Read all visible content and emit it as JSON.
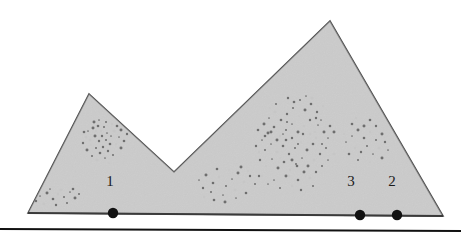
{
  "figure": {
    "kind": "scanned-geometry-figure",
    "canvas": {
      "width": 461,
      "height": 236
    },
    "background_color": "#ffffff",
    "polygon": {
      "name": "two-peak-mountain-polygon",
      "fill_color": "#dcdcdc",
      "stroke_color": "#4a4a4a",
      "stroke_width": 1.6,
      "points": "28,213 89,94 174,172 330,21 443,216"
    },
    "baseline": {
      "name": "baseline-segment",
      "stroke_color": "#3a3a3a",
      "stroke_width": 1.8,
      "x1": 28,
      "y1": 213,
      "x2": 443,
      "y2": 216
    },
    "page_rule": {
      "name": "page-rule",
      "stroke_color": "#111111",
      "stroke_width": 2.2,
      "x1": 0,
      "y1": 229,
      "x2": 461,
      "y2": 231
    },
    "markers": [
      {
        "label": "1",
        "cx": 113,
        "cy": 213,
        "r": 5.2,
        "color": "#111111",
        "label_x": 110,
        "label_y": 186
      },
      {
        "label": "3",
        "cx": 360,
        "cy": 215,
        "r": 5.2,
        "color": "#111111",
        "label_x": 351,
        "label_y": 186
      },
      {
        "label": "2",
        "cx": 397,
        "cy": 215,
        "r": 5.2,
        "color": "#111111",
        "label_x": 392,
        "label_y": 186
      }
    ],
    "speckle": {
      "color": "#6e6e6e",
      "noise_color": "#c6c6c6",
      "clusters": [
        {
          "name": "left-peak-cluster",
          "points": [
            [
              88,
              131
            ],
            [
              93,
              128
            ],
            [
              98,
              126
            ],
            [
              101,
              131
            ],
            [
              104,
              127
            ],
            [
              107,
              133
            ],
            [
              95,
              136
            ],
            [
              90,
              140
            ],
            [
              99,
              141
            ],
            [
              106,
              140
            ],
            [
              111,
              136
            ],
            [
              114,
              131
            ],
            [
              110,
              144
            ],
            [
              103,
              147
            ],
            [
              96,
              148
            ],
            [
              91,
              145
            ],
            [
              87,
              150
            ],
            [
              100,
              153
            ],
            [
              108,
              151
            ],
            [
              116,
              144
            ],
            [
              119,
              137
            ],
            [
              121,
              130
            ],
            [
              117,
              126
            ],
            [
              112,
              124
            ],
            [
              106,
              122
            ],
            [
              99,
              120
            ],
            [
              94,
              122
            ],
            [
              86,
              137
            ],
            [
              83,
              143
            ],
            [
              113,
              155
            ],
            [
              105,
              158
            ],
            [
              97,
              160
            ],
            [
              124,
              141
            ],
            [
              127,
              134
            ],
            [
              92,
              156
            ],
            [
              109,
              163
            ],
            [
              121,
              148
            ],
            [
              84,
              132
            ],
            [
              102,
              136
            ],
            [
              96,
              131
            ]
          ]
        },
        {
          "name": "bottom-left-sparse",
          "points": [
            [
              40,
              196
            ],
            [
              47,
              193
            ],
            [
              53,
              199
            ],
            [
              58,
              194
            ],
            [
              64,
              197
            ],
            [
              70,
              192
            ],
            [
              75,
              198
            ],
            [
              44,
              204
            ],
            [
              56,
              205
            ],
            [
              67,
              203
            ],
            [
              50,
              189
            ],
            [
              61,
              190
            ],
            [
              73,
              189
            ],
            [
              36,
              201
            ],
            [
              79,
              194
            ]
          ]
        },
        {
          "name": "lower-middle-sparse",
          "points": [
            [
              199,
              180
            ],
            [
              206,
              175
            ],
            [
              213,
              183
            ],
            [
              219,
              177
            ],
            [
              226,
              186
            ],
            [
              232,
              179
            ],
            [
              238,
              173
            ],
            [
              244,
              182
            ],
            [
              250,
              176
            ],
            [
              211,
              192
            ],
            [
              223,
              195
            ],
            [
              235,
              190
            ],
            [
              246,
              193
            ],
            [
              203,
              188
            ],
            [
              255,
              184
            ],
            [
              229,
              170
            ],
            [
              241,
              167
            ],
            [
              217,
              169
            ],
            [
              259,
              176
            ],
            [
              248,
              171
            ],
            [
              236,
              198
            ],
            [
              225,
              202
            ],
            [
              214,
              200
            ],
            [
              204,
              197
            ]
          ]
        },
        {
          "name": "right-main-cluster",
          "points": [
            [
              262,
              140
            ],
            [
              268,
              133
            ],
            [
              274,
              127
            ],
            [
              280,
              136
            ],
            [
              286,
              130
            ],
            [
              292,
              124
            ],
            [
              298,
              132
            ],
            [
              304,
              126
            ],
            [
              310,
              120
            ],
            [
              265,
              150
            ],
            [
              271,
              144
            ],
            [
              277,
              152
            ],
            [
              283,
              146
            ],
            [
              289,
              154
            ],
            [
              295,
              148
            ],
            [
              301,
              142
            ],
            [
              307,
              150
            ],
            [
              313,
              144
            ],
            [
              260,
              160
            ],
            [
              266,
              166
            ],
            [
              272,
              159
            ],
            [
              278,
              168
            ],
            [
              284,
              162
            ],
            [
              290,
              170
            ],
            [
              296,
              164
            ],
            [
              302,
              158
            ],
            [
              308,
              166
            ],
            [
              314,
              160
            ],
            [
              320,
              154
            ],
            [
              326,
              148
            ],
            [
              269,
              118
            ],
            [
              275,
              112
            ],
            [
              281,
              120
            ],
            [
              287,
              114
            ],
            [
              293,
              108
            ],
            [
              299,
              116
            ],
            [
              305,
              110
            ],
            [
              311,
              104
            ],
            [
              317,
              112
            ],
            [
              323,
              106
            ],
            [
              318,
              125
            ],
            [
              324,
              132
            ],
            [
              330,
              126
            ],
            [
              316,
              138
            ],
            [
              322,
              144
            ],
            [
              328,
              138
            ],
            [
              334,
              132
            ],
            [
              310,
              134
            ],
            [
              316,
              118
            ],
            [
              300,
              100
            ],
            [
              306,
              96
            ],
            [
              312,
              98
            ],
            [
              294,
              102
            ],
            [
              288,
              98
            ],
            [
              276,
              104
            ],
            [
              270,
              108
            ],
            [
              264,
              124
            ],
            [
              258,
              130
            ],
            [
              256,
              146
            ],
            [
              262,
              176
            ],
            [
              274,
              180
            ],
            [
              286,
              176
            ],
            [
              298,
              180
            ],
            [
              292,
              186
            ],
            [
              280,
              188
            ],
            [
              268,
              184
            ],
            [
              304,
              172
            ],
            [
              310,
              178
            ],
            [
              316,
              172
            ],
            [
              322,
              166
            ],
            [
              328,
              160
            ],
            [
              334,
              154
            ],
            [
              286,
              140
            ],
            [
              292,
              138
            ],
            [
              298,
              144
            ],
            [
              280,
              158
            ],
            [
              292,
              160
            ],
            [
              297,
              166
            ],
            [
              303,
              134
            ],
            [
              315,
              132
            ],
            [
              321,
              120
            ],
            [
              271,
              132
            ],
            [
              265,
              136
            ],
            [
              259,
              152
            ],
            [
              287,
              122
            ],
            [
              283,
              134
            ],
            [
              277,
              140
            ],
            [
              289,
              176
            ],
            [
              301,
              190
            ],
            [
              313,
              186
            ]
          ]
        },
        {
          "name": "right-small-cluster",
          "points": [
            [
              352,
              136
            ],
            [
              358,
              130
            ],
            [
              364,
              138
            ],
            [
              370,
              132
            ],
            [
              376,
              140
            ],
            [
              346,
              142
            ],
            [
              382,
              134
            ],
            [
              355,
              148
            ],
            [
              361,
              152
            ],
            [
              367,
              146
            ],
            [
              373,
              154
            ],
            [
              379,
              148
            ],
            [
              349,
              154
            ],
            [
              385,
              142
            ],
            [
              358,
              160
            ],
            [
              370,
              162
            ],
            [
              364,
              126
            ],
            [
              352,
              124
            ],
            [
              376,
              126
            ],
            [
              344,
              134
            ],
            [
              388,
              150
            ],
            [
              382,
              158
            ],
            [
              370,
              120
            ],
            [
              356,
              118
            ]
          ]
        }
      ]
    }
  }
}
